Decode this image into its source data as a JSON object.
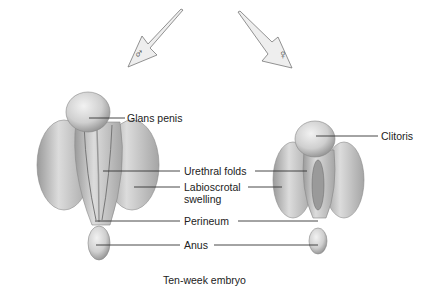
{
  "symbols": {
    "male": "♂",
    "female": "♀"
  },
  "labels": {
    "glans_penis": "Glans penis",
    "clitoris": "Clitoris",
    "urethral_folds": "Urethral folds",
    "labioscrotal_line1": "Labioscrotal",
    "labioscrotal_line2": "swelling",
    "perineum": "Perineum",
    "anus": "Anus"
  },
  "caption": "Ten-week embryo",
  "colors": {
    "tissue_light": "#e4e4e4",
    "tissue_mid": "#c4c4c4",
    "tissue_dark": "#8a8a8a",
    "arrow_fill": "#eeeeee",
    "leader_line": "#333333"
  }
}
